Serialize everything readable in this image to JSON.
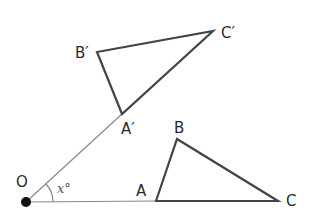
{
  "diagram": {
    "type": "rotation",
    "colors": {
      "triangle": "#444444",
      "ray": "#888888",
      "center": "#111111",
      "text": "#2b2b2b"
    },
    "center": {
      "label": "O",
      "x": 26,
      "y": 202
    },
    "angle_label": "x°",
    "original": {
      "A": {
        "label": "A",
        "x": 156,
        "y": 201
      },
      "B": {
        "label": "B",
        "x": 177,
        "y": 139
      },
      "C": {
        "label": "C",
        "x": 278,
        "y": 201
      }
    },
    "image": {
      "A": {
        "label": "A′",
        "x": 122,
        "y": 114
      },
      "B": {
        "label": "B′",
        "x": 97,
        "y": 52
      },
      "C": {
        "label": "C′",
        "x": 213,
        "y": 31
      }
    }
  }
}
